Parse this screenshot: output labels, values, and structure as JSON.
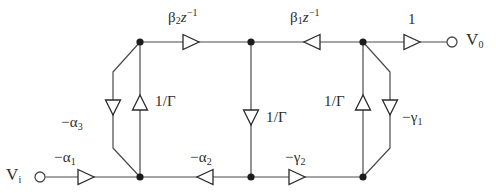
{
  "diagram": {
    "type": "signal-flow-graph",
    "terminals": {
      "input": "V",
      "input_sub": "i",
      "output": "V",
      "output_sub": "0"
    },
    "branch_labels": {
      "beta2": "β2z⁻¹",
      "beta1": "β1z⁻¹",
      "unity": "1",
      "alpha1": "−α1",
      "alpha2": "−α2",
      "alpha3": "−α3",
      "gamma1": "−γ1",
      "gamma2": "−γ2",
      "one_over_gamma_left": "1/Γ",
      "one_over_gamma_center": "1/Γ",
      "one_over_gamma_right": "1/Γ"
    },
    "label_parts": {
      "beta2": {
        "base": "β",
        "sub": "2",
        "var": "z",
        "sup": "−1"
      },
      "beta1": {
        "base": "β",
        "sub": "1",
        "var": "z",
        "sup": "−1"
      },
      "unity": {
        "base": "1"
      },
      "alpha1": {
        "base": "−α",
        "sub": "1"
      },
      "alpha2": {
        "base": "−α",
        "sub": "2"
      },
      "alpha3": {
        "base": "−α",
        "sub": "3"
      },
      "gamma1": {
        "base": "−γ",
        "sub": "1"
      },
      "gamma2": {
        "base": "−γ",
        "sub": "2"
      },
      "gamma_recip": {
        "base": "1/Γ"
      }
    },
    "colors": {
      "wire": "#4a4a4a",
      "node": "#1c1c1c",
      "arrow_stroke": "#2b2b2b",
      "arrow_fill": "#ffffff",
      "text": "#2d2d2d",
      "background": "#ffffff"
    },
    "nodes": [
      {
        "name": "input-terminal",
        "x": 38,
        "y": 177
      },
      {
        "name": "node-bottom-left",
        "x": 140,
        "y": 177
      },
      {
        "name": "node-bottom-center",
        "x": 251,
        "y": 177
      },
      {
        "name": "node-bottom-right",
        "x": 363,
        "y": 177
      },
      {
        "name": "node-top-left",
        "x": 140,
        "y": 42
      },
      {
        "name": "node-top-center",
        "x": 251,
        "y": 42
      },
      {
        "name": "node-top-right",
        "x": 363,
        "y": 42
      },
      {
        "name": "output-terminal",
        "x": 455,
        "y": 42
      }
    ],
    "branches": [
      {
        "name": "input-to-bottom-left",
        "label": "alpha1",
        "direction": "right"
      },
      {
        "name": "top-left-to-top-center",
        "label": "beta2",
        "direction": "right"
      },
      {
        "name": "top-right-to-top-center",
        "label": "beta1",
        "direction": "left"
      },
      {
        "name": "top-right-to-output",
        "label": "unity",
        "direction": "right"
      },
      {
        "name": "bottom-center-to-bottom-left",
        "label": "alpha2",
        "direction": "left"
      },
      {
        "name": "bottom-center-to-bottom-right",
        "label": "gamma2",
        "direction": "right"
      },
      {
        "name": "bottom-left-to-top-left",
        "label": "one_over_gamma_left",
        "direction": "up"
      },
      {
        "name": "top-center-to-bottom-center",
        "label": "one_over_gamma_center",
        "direction": "down"
      },
      {
        "name": "bottom-right-to-top-right",
        "label": "one_over_gamma_right",
        "direction": "up"
      },
      {
        "name": "left-feedback-octagon",
        "label": "alpha3",
        "direction": "down"
      },
      {
        "name": "right-feedback-octagon",
        "label": "gamma1",
        "direction": "down"
      }
    ]
  }
}
